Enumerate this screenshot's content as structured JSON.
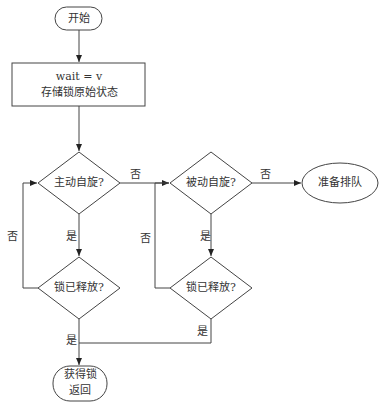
{
  "flowchart": {
    "start": {
      "label": "开始"
    },
    "process": {
      "line1": "wait = v",
      "line2": "存储锁原始状态"
    },
    "decision_active_spin": {
      "label": "主动自旋?"
    },
    "decision_lock_released_1": {
      "label": "锁已释放?"
    },
    "decision_passive_spin": {
      "label": "被动自旋?"
    },
    "decision_lock_released_2": {
      "label": "锁已释放?"
    },
    "queue": {
      "label": "准备排队"
    },
    "end": {
      "line1": "获得锁",
      "line2": "返回"
    },
    "edge_labels": {
      "active_no": "否",
      "active_yes": "是",
      "released1_no": "否",
      "released1_yes": "是",
      "passive_no": "否",
      "passive_yes": "是",
      "released2_no": "否",
      "released2_yes": "是"
    }
  }
}
